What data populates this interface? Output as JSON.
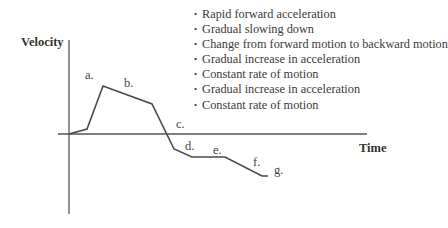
{
  "diagram": {
    "y_axis_label": "Velocity",
    "x_axis_label": "Time",
    "bullet_glyph": "•",
    "legend_items": [
      "Rapid forward acceleration",
      "Gradual slowing down",
      "Change from forward motion to backward motion",
      "Gradual increase in acceleration",
      "Constant rate of motion",
      "Gradual increase in acceleration",
      "Constant rate of motion"
    ],
    "point_labels": [
      "a.",
      "b.",
      "c.",
      "d.",
      "e.",
      "f.",
      "g."
    ],
    "colors": {
      "line": "#4a4a4a",
      "axis": "#555555",
      "text": "#3a3a3a"
    }
  }
}
